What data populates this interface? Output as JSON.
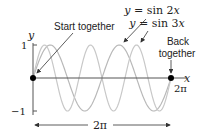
{
  "diagram": {
    "axes": {
      "x_label": "x",
      "y_label": "y",
      "y_ticks": [
        {
          "value": 1,
          "label": "1"
        },
        {
          "value": -1,
          "label": "−1"
        }
      ],
      "x_end_label": "2π"
    },
    "curves": [
      {
        "name": "sin2x",
        "label_prefix": "y = ",
        "label_fn": "sin 2",
        "label_var": "x",
        "frequency": 2,
        "color": "#b8b8b8"
      },
      {
        "name": "sin3x",
        "label_prefix": "y = ",
        "label_fn": "sin 3",
        "label_var": "x",
        "frequency": 3,
        "color": "#c8c8c8"
      }
    ],
    "annotations": {
      "start": "Start together",
      "back_line1": "Back",
      "back_line2": "together"
    },
    "period_arrow_label": "2π",
    "colors": {
      "axis": "#555555",
      "dot": "#000000",
      "arrow": "#333333"
    }
  }
}
